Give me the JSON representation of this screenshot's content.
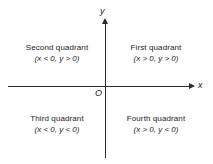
{
  "figure": {
    "type": "cartesian-plane-quadrants",
    "background_color": "#ffffff",
    "line_color": "#2b2b2b",
    "text_color": "#1a1a1a"
  },
  "axes": {
    "x_label": "x",
    "y_label": "y",
    "origin_label": "O",
    "x_arrow": "arrow-right",
    "y_arrow": "arrow-up"
  },
  "quadrants": [
    {
      "id": "first",
      "title": "First quadrant",
      "condition": "(x > 0, y > 0)"
    },
    {
      "id": "second",
      "title": "Second quadrant",
      "condition": "(x < 0, y > 0)"
    },
    {
      "id": "third",
      "title": "Third quadrant",
      "condition": "(x < 0, y < 0)"
    },
    {
      "id": "fourth",
      "title": "Fourth quadrant",
      "condition": "(x > 0, y < 0)"
    }
  ]
}
